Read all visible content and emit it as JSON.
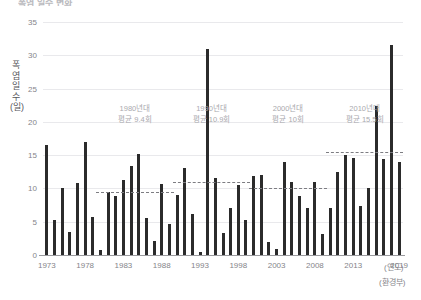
{
  "title": "폭염 일수 변화",
  "yAxis": {
    "title": "폭염 일수(일)",
    "unit": "일",
    "min": 0,
    "max": 35,
    "ticks": [
      0,
      5,
      10,
      15,
      20,
      25,
      30,
      35
    ]
  },
  "xAxis": {
    "unit_label": "(연도)",
    "ticks": [
      1973,
      1978,
      1983,
      1988,
      1993,
      1998,
      2003,
      2008,
      2013,
      2019
    ]
  },
  "source": "(환경부)",
  "decade_notes": [
    {
      "name": "decade-1980s",
      "line1": "1980년대",
      "line2": "평균 9.4회",
      "year_center": 1984.5,
      "value": 9.4
    },
    {
      "name": "decade-1990s",
      "line1": "1990년대",
      "line2": "평균 10.9회",
      "year_center": 1994.5,
      "value": 10.9
    },
    {
      "name": "decade-2000s",
      "line1": "2000년대",
      "line2": "평균 10회",
      "year_center": 2004.5,
      "value": 10.0
    },
    {
      "name": "decade-2010s",
      "line1": "2010년대",
      "line2": "평균 15.5회",
      "year_center": 2014.5,
      "value": 15.5
    }
  ],
  "average_lines": [
    {
      "name": "avg-line-1980s",
      "value": 9.4,
      "start_year": 1980,
      "end_year": 1989
    },
    {
      "name": "avg-line-1990s",
      "value": 10.9,
      "start_year": 1990,
      "end_year": 1999
    },
    {
      "name": "avg-line-2000s",
      "value": 10.0,
      "start_year": 2000,
      "end_year": 2009
    },
    {
      "name": "avg-line-2010s",
      "value": 15.5,
      "start_year": 2010,
      "end_year": 2019
    }
  ],
  "colors": {
    "bar": "#2b2b2b",
    "grid": "#e9e9ec",
    "axis": "#9a9a9e",
    "text": "#85858a",
    "annotation": "#a9a9ae",
    "background": "#ffffff"
  },
  "chart_data": {
    "type": "bar",
    "title": "폭염 일수 변화",
    "xlabel": "(연도)",
    "ylabel": "폭염 일수(일)",
    "ylim": [
      0,
      35
    ],
    "grid": true,
    "legend": "none",
    "categories": [
      1973,
      1974,
      1975,
      1976,
      1977,
      1978,
      1979,
      1980,
      1981,
      1982,
      1983,
      1984,
      1985,
      1986,
      1987,
      1988,
      1989,
      1990,
      1991,
      1992,
      1993,
      1994,
      1995,
      1996,
      1997,
      1998,
      1999,
      2000,
      2001,
      2002,
      2003,
      2004,
      2005,
      2006,
      2007,
      2008,
      2009,
      2010,
      2011,
      2012,
      2013,
      2014,
      2015,
      2016,
      2017,
      2018,
      2019
    ],
    "values": [
      16.5,
      5.2,
      10.0,
      3.4,
      10.8,
      17.0,
      5.7,
      0.7,
      9.4,
      8.8,
      11.3,
      13.4,
      15.2,
      5.5,
      2.1,
      10.6,
      4.7,
      9.0,
      13.0,
      6.1,
      0.4,
      31.0,
      11.5,
      3.3,
      7.0,
      10.5,
      5.2,
      11.9,
      12.0,
      1.9,
      0.9,
      13.9,
      11.0,
      8.8,
      7.0,
      10.9,
      3.1,
      7.1,
      12.4,
      15.0,
      14.6,
      7.4,
      10.1,
      22.4,
      14.4,
      31.5,
      14.0
    ],
    "annotations": [
      {
        "text": "1980년대 평균 9.4회",
        "value": 9.4
      },
      {
        "text": "1990년대 평균 10.9회",
        "value": 10.9
      },
      {
        "text": "2000년대 평균 10회",
        "value": 10.0
      },
      {
        "text": "2010년대 평균 15.5회",
        "value": 15.5
      }
    ],
    "source": "(환경부)"
  }
}
